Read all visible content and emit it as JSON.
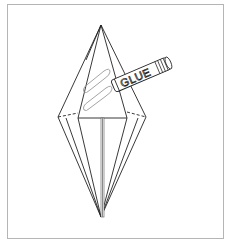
{
  "diagram": {
    "glue_label": "GLUE",
    "colors": {
      "line": "#222222",
      "frame": "#b5b5b5",
      "glue_outline": "#9a9a9a",
      "center_line": "#8a8a8a"
    }
  }
}
